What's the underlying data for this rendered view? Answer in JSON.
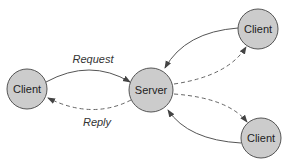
{
  "diagram": {
    "title": "",
    "colors": {
      "node_fill": "#cccccc",
      "node_stroke": "#555555",
      "edge": "#555555",
      "background": "#ffffff"
    },
    "nodes": [
      {
        "id": "client-left",
        "label": "Client",
        "cx": 27,
        "cy": 89,
        "r": 20
      },
      {
        "id": "server",
        "label": "Server",
        "cx": 151,
        "cy": 90,
        "r": 22
      },
      {
        "id": "client-top-right",
        "label": "Client",
        "cx": 258,
        "cy": 29,
        "r": 20
      },
      {
        "id": "client-bottom-right",
        "label": "Client",
        "cx": 261,
        "cy": 138,
        "r": 20
      }
    ],
    "edges": [
      {
        "from": "client-left",
        "to": "server",
        "style": "solid",
        "label": "Request"
      },
      {
        "from": "server",
        "to": "client-left",
        "style": "dashed",
        "label": "Reply"
      },
      {
        "from": "client-top-right",
        "to": "server",
        "style": "solid",
        "label": ""
      },
      {
        "from": "server",
        "to": "client-top-right",
        "style": "dashed",
        "label": ""
      },
      {
        "from": "server",
        "to": "client-bottom-right",
        "style": "dashed",
        "label": ""
      },
      {
        "from": "client-bottom-right",
        "to": "server",
        "style": "solid",
        "label": ""
      }
    ],
    "labels": {
      "request": "Request",
      "reply": "Reply"
    }
  }
}
